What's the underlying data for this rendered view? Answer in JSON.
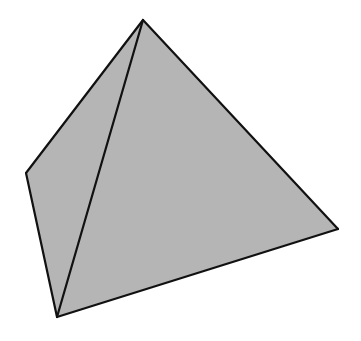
{
  "diagram": {
    "shape": "tetrahedron",
    "fill_color": "#b5b5b5",
    "stroke_color": "#111111",
    "stroke_width": 2.2,
    "vertices": {
      "apex": [
        143,
        20
      ],
      "left": [
        26,
        173
      ],
      "bottom": [
        57,
        317
      ],
      "right": [
        338,
        229
      ]
    },
    "faces": [
      {
        "name": "left-face",
        "points": [
          "apex",
          "left",
          "bottom"
        ]
      },
      {
        "name": "front-face",
        "points": [
          "apex",
          "bottom",
          "right"
        ]
      }
    ],
    "edges": [
      [
        "apex",
        "left"
      ],
      [
        "left",
        "bottom"
      ],
      [
        "bottom",
        "right"
      ],
      [
        "right",
        "apex"
      ],
      [
        "apex",
        "bottom"
      ]
    ]
  }
}
